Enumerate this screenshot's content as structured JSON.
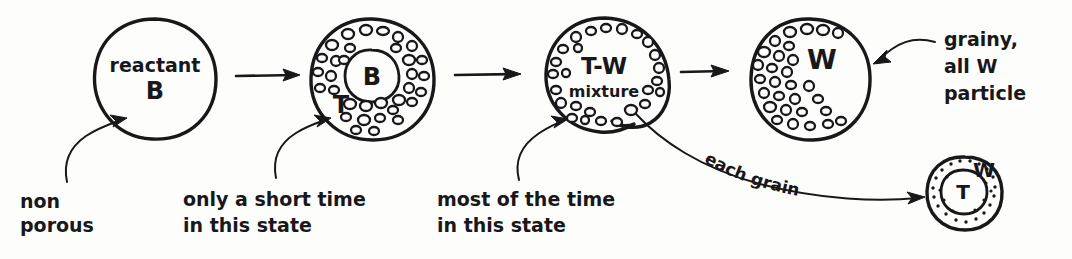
{
  "figure": {
    "ink_color": "#18181a",
    "background_color": "#fdfdfc"
  },
  "stages": [
    {
      "id": "stage-1",
      "name": "non-porous-reactant",
      "core_label": "",
      "title_line1": "reactant",
      "title_line2": "B",
      "shell_label": "",
      "grain_count": 0
    },
    {
      "id": "stage-2",
      "name": "shell-T-core-B",
      "core_label": "B",
      "title_line1": "",
      "title_line2": "",
      "shell_label": "T",
      "grain_count": 44
    },
    {
      "id": "stage-3",
      "name": "T-W-mixture",
      "core_label": "",
      "title_line1": "T-W",
      "title_line2": "mixture",
      "shell_label": "",
      "grain_count": 26
    },
    {
      "id": "stage-4",
      "name": "all-W-grainy",
      "core_label": "",
      "title_line1": "W",
      "title_line2": "",
      "shell_label": "",
      "grain_count": 34
    }
  ],
  "inset": {
    "name": "each-grain-detail",
    "outer_label": "W",
    "inner_label": "T",
    "caption": "each grain"
  },
  "annotations": [
    {
      "id": "annot-1",
      "name": "non-porous",
      "lines": [
        "non",
        "porous"
      ]
    },
    {
      "id": "annot-2",
      "name": "short-time-state",
      "lines": [
        "only a short time",
        "in this  state"
      ]
    },
    {
      "id": "annot-3",
      "name": "most-time-state",
      "lines": [
        "most of the time",
        "in this state"
      ]
    },
    {
      "id": "annot-4",
      "name": "grainy-all-w-particle",
      "lines": [
        "grainy,",
        "all W",
        "particle"
      ]
    }
  ],
  "arrows": [
    {
      "id": "arrow-1",
      "name": "stage1-to-stage2"
    },
    {
      "id": "arrow-2",
      "name": "stage2-to-stage3"
    },
    {
      "id": "arrow-3",
      "name": "stage3-to-stage4"
    }
  ]
}
